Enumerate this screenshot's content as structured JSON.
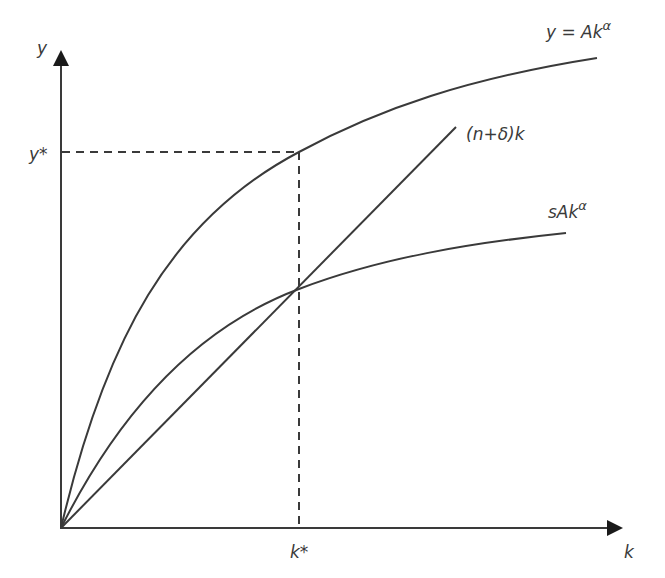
{
  "diagram": {
    "axes": {
      "x_label": "k",
      "y_label": "y",
      "origin_px": [
        61,
        528
      ],
      "x_end_px": 623,
      "y_end_px": 50
    },
    "curves": [
      {
        "id": "production",
        "label": "y = Akα",
        "label_main": "y = Ak",
        "label_sup": "α",
        "type": "concave",
        "end_px": [
          597,
          58
        ]
      },
      {
        "id": "depreciation_line",
        "label": "(n+δ)k",
        "type": "linear",
        "end_px": [
          456,
          127
        ]
      },
      {
        "id": "savings",
        "label": "sAkα",
        "label_main": "sAk",
        "label_sup": "α",
        "type": "concave",
        "end_px": [
          566,
          233
        ]
      }
    ],
    "steady_state": {
      "k_label": "k*",
      "y_label": "y*",
      "k_px": 299,
      "y_px": 152,
      "intersection_px": [
        299,
        289
      ]
    },
    "colors": {
      "line": "#3a3a3a",
      "background": "#ffffff"
    }
  }
}
